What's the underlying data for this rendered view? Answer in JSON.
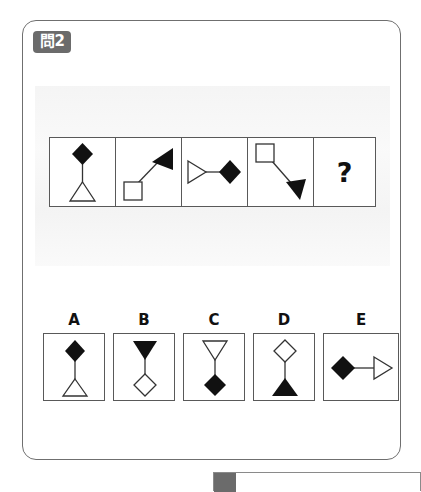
{
  "page": {
    "background_color": "#ffffff",
    "card_border_color": "#6f6f6f"
  },
  "question": {
    "badge_label": "問2",
    "badge_background": "#6b6b6b",
    "badge_text_color": "#ffffff"
  },
  "sequence": {
    "missing_marker": "?",
    "cells": [
      {
        "index": 1,
        "name": "sequence-cell-1",
        "description": "filled diamond above, open triangle pointing up below, joined by a vertical line",
        "orientation": "vertical",
        "top_shape": "filled-diamond",
        "bottom_shape": "open-triangle-up"
      },
      {
        "index": 2,
        "name": "sequence-cell-2",
        "description": "open square at lower-left joined by a diagonal line to a filled triangle at upper-right",
        "orientation": "diagonal-up-right",
        "start_shape": "open-square",
        "end_shape": "filled-triangle-right"
      },
      {
        "index": 3,
        "name": "sequence-cell-3",
        "description": "open triangle pointing right at left joined by a horizontal line to a filled diamond at right",
        "orientation": "horizontal",
        "start_shape": "open-triangle-right",
        "end_shape": "filled-diamond"
      },
      {
        "index": 4,
        "name": "sequence-cell-4",
        "description": "open square at upper-left joined by a diagonal line to a filled triangle at lower-right",
        "orientation": "diagonal-down-right",
        "start_shape": "open-square",
        "end_shape": "filled-triangle-right"
      },
      {
        "index": 5,
        "name": "sequence-cell-answer",
        "description": "unknown answer cell showing a question mark",
        "orientation": "none",
        "content": "?"
      }
    ]
  },
  "options": [
    {
      "label": "A",
      "description": "filled diamond above, open triangle pointing up below, vertical line",
      "top_shape": "filled-diamond",
      "bottom_shape": "open-triangle-up"
    },
    {
      "label": "B",
      "description": "filled triangle pointing down above, open diamond below, vertical line",
      "top_shape": "filled-triangle-down",
      "bottom_shape": "open-diamond"
    },
    {
      "label": "C",
      "description": "open triangle pointing down above, filled diamond below, vertical line",
      "top_shape": "open-triangle-down",
      "bottom_shape": "filled-diamond"
    },
    {
      "label": "D",
      "description": "open diamond above, filled triangle pointing up below, vertical line",
      "top_shape": "open-diamond",
      "bottom_shape": "filled-triangle-up"
    },
    {
      "label": "E",
      "description": "filled diamond at left joined by a horizontal line to an open triangle pointing right",
      "start_shape": "filled-diamond",
      "end_shape": "open-triangle-right"
    }
  ]
}
